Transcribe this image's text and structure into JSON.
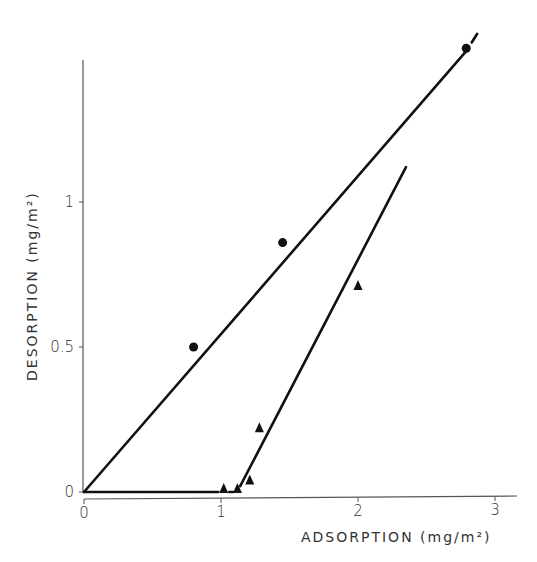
{
  "chart_data": {
    "type": "scatter",
    "title": "",
    "xlabel": "ADSORPTION (mg/m²)",
    "ylabel": "DESORPTION (mg/m²)",
    "xlim": [
      0,
      3.15
    ],
    "ylim": [
      0,
      1.6
    ],
    "x_ticks": [
      "0",
      "1",
      "2",
      "3"
    ],
    "y_ticks": [
      "0",
      "0.5",
      "1"
    ],
    "grid": false,
    "legend": null,
    "series": [
      {
        "name": "circles",
        "marker": "circle",
        "points": [
          [
            0.8,
            0.5
          ],
          [
            1.45,
            0.86
          ],
          [
            2.79,
            1.53
          ]
        ],
        "fit_line": [
          [
            0,
            0
          ],
          [
            2.79,
            1.52
          ]
        ],
        "fit_line_extension_dashed": [
          [
            2.83,
            1.55
          ],
          [
            2.87,
            1.58
          ]
        ]
      },
      {
        "name": "triangles",
        "marker": "triangle",
        "points": [
          [
            1.02,
            0.01
          ],
          [
            1.12,
            0.01
          ],
          [
            1.21,
            0.04
          ],
          [
            1.28,
            0.22
          ],
          [
            2.0,
            0.71
          ]
        ],
        "fit_line_flat": [
          [
            0,
            0
          ],
          [
            0.98,
            0.0
          ]
        ],
        "fit_line_flat_gap": [
          [
            1.06,
            0.0
          ],
          [
            1.09,
            0.0
          ]
        ],
        "fit_line_steep": [
          [
            1.14,
            0.02
          ],
          [
            2.35,
            1.12
          ]
        ]
      }
    ]
  },
  "axes": {
    "x_label_text": "ADSORPTION (mg/m²)",
    "y_label_text": "DESORPTION (mg/m²)",
    "x_ticks": [
      "0",
      "1",
      "2",
      "3"
    ],
    "y_ticks": [
      "0",
      "0.5",
      "1"
    ]
  }
}
